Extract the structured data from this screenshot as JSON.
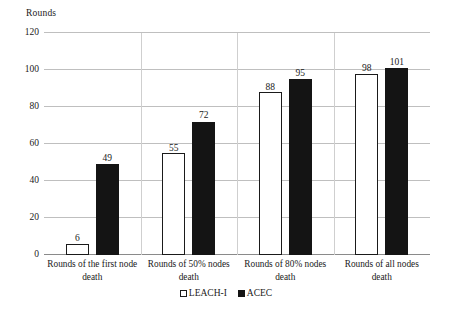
{
  "chart_data": {
    "type": "bar",
    "title": "",
    "subtitle": "",
    "xlabel": "",
    "ylabel": "Rounds",
    "ylim": [
      0,
      120
    ],
    "yticks": [
      0,
      20,
      40,
      60,
      80,
      100,
      120
    ],
    "grid": true,
    "legend_position": "bottom-center",
    "categories": [
      "Rounds of the first node death",
      "Rounds of 50% nodes death",
      "Rounds of 80% nodes death",
      "Rounds of all nodes death"
    ],
    "series": [
      {
        "name": "LEACH-I",
        "color": "#ffffff",
        "edge_color": "#1a1a1a",
        "values": [
          6,
          55,
          88,
          98
        ]
      },
      {
        "name": "ACEC",
        "color": "#141414",
        "edge_color": "#141414",
        "values": [
          49,
          72,
          95,
          101
        ]
      }
    ],
    "value_labels": [
      [
        "6",
        "49"
      ],
      [
        "55",
        "72"
      ],
      [
        "88",
        "95"
      ],
      [
        "98",
        "101"
      ]
    ]
  },
  "axis": {
    "y_title": "Rounds",
    "y_tick_labels": [
      "120",
      "100",
      "80",
      "60",
      "40",
      "20",
      "0"
    ]
  },
  "category_labels": [
    {
      "line1": "Rounds of the first node",
      "line2": "death"
    },
    {
      "line1": "Rounds of 50% nodes",
      "line2": "death"
    },
    {
      "line1": "Rounds of 80% nodes",
      "line2": "death"
    },
    {
      "line1": "Rounds of all nodes death",
      "line2": ""
    }
  ],
  "legend": {
    "items": [
      {
        "label": "LEACH-I",
        "marker": "open-square-marker"
      },
      {
        "label": "ACEC",
        "marker": "filled-square-marker"
      }
    ]
  },
  "colors": {
    "series_a": "#ffffff",
    "series_b": "#141414",
    "gridline": "#bfbfbf",
    "axis": "#8a8a8a",
    "text": "#1a1a1a",
    "background": "#ffffff"
  }
}
